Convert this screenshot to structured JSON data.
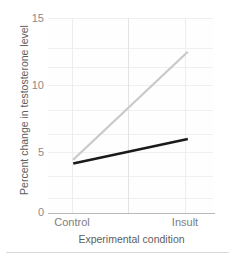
{
  "chart_data": {
    "type": "line",
    "title": "",
    "xlabel": "Experimental condition",
    "ylabel": "Percent change in testosterone level",
    "categories": [
      "Control",
      "Insult"
    ],
    "x": [
      0,
      1
    ],
    "xtick_labels": [
      "Control",
      "Insult"
    ],
    "ytick_labels": [
      "0",
      "5",
      "10",
      "15"
    ],
    "yticks": [
      0,
      5,
      10,
      15
    ],
    "ylim": [
      0,
      15
    ],
    "xlim": [
      -0.22,
      1.22
    ],
    "grid": true,
    "grid_axis": "both",
    "legend": false,
    "legend_position": "none",
    "series": [
      {
        "name": "South",
        "values": [
          4.1,
          12.4
        ],
        "color": "#c9c9c9",
        "line_width": 2.2
      },
      {
        "name": "North",
        "values": [
          3.8,
          5.7
        ],
        "color": "#1a1a1a",
        "line_width": 2.6
      }
    ],
    "annotations": []
  },
  "axis": {
    "y_title": "Percent change in testosterone level",
    "x_title": "Experimental condition",
    "y_ticks": [
      {
        "label": "15",
        "value": 15
      },
      {
        "label": "10",
        "value": 10
      },
      {
        "label": "5",
        "value": 5
      },
      {
        "label": "0",
        "value": 0
      }
    ],
    "x_ticks": [
      {
        "label": "Control",
        "value": 0
      },
      {
        "label": "Insult",
        "value": 1
      }
    ]
  },
  "colors": {
    "series_gray": "#c9c9c9",
    "series_black": "#1a1a1a",
    "gridline": "#f0f0f0",
    "axis_line": "#b9b9b9",
    "tick_text": "#8a8a8a",
    "title_text": "#5e5e5e",
    "background": "#ffffff"
  }
}
